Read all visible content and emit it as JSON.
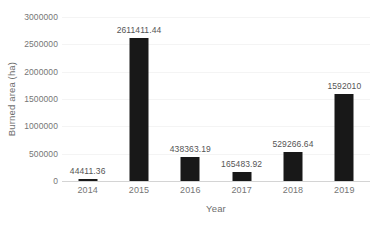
{
  "chart_data": {
    "type": "bar",
    "title": "",
    "xlabel": "Year",
    "ylabel": "Burned area (ha)",
    "categories": [
      "2014",
      "2015",
      "2016",
      "2017",
      "2018",
      "2019"
    ],
    "values": [
      44411.36,
      2611411.44,
      438363.19,
      165483.92,
      529266.64,
      1592010
    ],
    "value_labels": [
      "44411.36",
      "2611411.44",
      "438363.19",
      "165483.92",
      "529266.64",
      "1592010"
    ],
    "ylim": [
      0,
      3000000
    ],
    "ytick_values": [
      3000000,
      2500000,
      2000000,
      1500000,
      1000000,
      500000,
      0
    ],
    "ytick_labels": [
      "3000000",
      "2500000",
      "2000000",
      "1500000",
      "1000000",
      "500000",
      "0"
    ],
    "grid": "horizontal",
    "legend": "none",
    "bar_color": "#181818",
    "gridline_color": "#f4f4f4",
    "axis_line_color": "#d4d4d4",
    "label_color": "#767676",
    "plot_background": "#ffffff"
  }
}
